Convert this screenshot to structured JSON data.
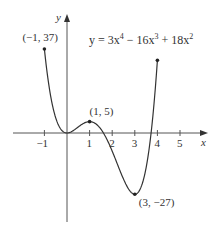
{
  "chart_data": {
    "type": "line",
    "equation": {
      "prefix": "y = 3x",
      "exp1": "4",
      "mid1": " − 16x",
      "exp2": "3",
      "mid2": " + 18x",
      "exp3": "2"
    },
    "xlabel": "x",
    "ylabel": "y",
    "xlim": [
      -1,
      4
    ],
    "x_ticks": [
      -1,
      1,
      2,
      3,
      4,
      5
    ],
    "x_tick_labels": [
      "−1",
      "1",
      "2",
      "3",
      "4",
      "5"
    ],
    "grid": false,
    "series": [
      {
        "name": "y = 3x^4 - 16x^3 + 18x^2",
        "coefficients": {
          "x4": 3,
          "x3": -16,
          "x2": 18
        },
        "domain": [
          -1,
          4
        ],
        "x": [
          -1,
          -0.5,
          0,
          0.5,
          1,
          1.5,
          2,
          2.5,
          3,
          3.5,
          4
        ],
        "y": [
          37,
          6.69,
          0,
          2.69,
          5,
          0.19,
          -8,
          -17.81,
          -27,
          -19.69,
          32
        ]
      }
    ],
    "annotations": [
      {
        "label": "(−1, 37)",
        "x": -1,
        "y": 37
      },
      {
        "label": "(1, 5)",
        "x": 1,
        "y": 5
      },
      {
        "label": "(3, −27)",
        "x": 3,
        "y": -27
      }
    ]
  }
}
